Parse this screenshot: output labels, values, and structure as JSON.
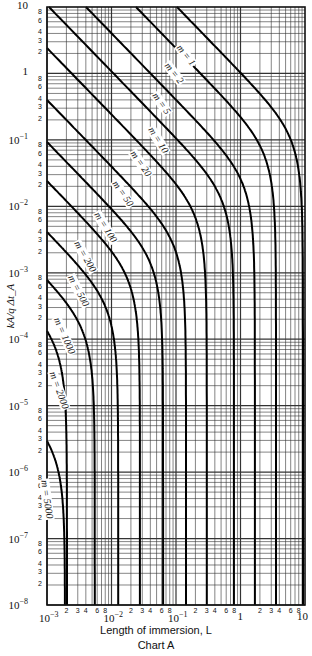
{
  "chart_data": {
    "type": "line",
    "title": "",
    "caption": "Chart A",
    "xlabel": "Length of immersion, L",
    "ylabel": "kA/q Δt_A",
    "xscale": "log",
    "yscale": "log",
    "xlim": [
      0.001,
      10
    ],
    "ylim": [
      1e-08,
      10
    ],
    "grid": true,
    "x_major_ticks": [
      "10^-3",
      "10^-2",
      "10^-1",
      "1",
      "10"
    ],
    "x_minor_tick_labels": [
      "2",
      "3",
      "4",
      "6",
      "8"
    ],
    "y_major_ticks": [
      "10",
      "1",
      "10^-1",
      "10^-2",
      "10^-3",
      "10^-4",
      "10^-5",
      "10^-6",
      "10^-7",
      "10^-8"
    ],
    "y_minor_tick_labels": [
      "8",
      "6",
      "4",
      "3",
      "2"
    ],
    "series": [
      {
        "name": "m = 1",
        "start_px": [
          177,
          7
        ],
        "end_L": 9.3
      },
      {
        "name": "m = 2",
        "start_px": [
          136,
          7
        ],
        "end_L": 3.55
      },
      {
        "name": "m = 5",
        "start_px": [
          86,
          7
        ],
        "end_L": 1.67
      },
      {
        "name": "m = 10",
        "start_px": [
          49,
          7
        ],
        "end_L": 0.79
      },
      {
        "name": "m = 20",
        "start_px": [
          47,
          48
        ],
        "end_L": 0.3
      },
      {
        "name": "m = 50",
        "start_px": [
          47,
          100
        ],
        "end_L": 0.143
      },
      {
        "name": "m = 100",
        "start_px": [
          47,
          142
        ],
        "end_L": 0.063
      },
      {
        "name": "m = 200",
        "start_px": [
          47,
          181
        ],
        "end_L": 0.0276
      },
      {
        "name": "m = 500",
        "start_px": [
          47,
          232
        ],
        "end_L": 0.0127
      },
      {
        "name": "m = 1000",
        "start_px": [
          47,
          280
        ],
        "end_L": 0.0055
      },
      {
        "name": "m = 2000",
        "start_px": [
          47,
          331
        ],
        "end_L": 0.00204
      },
      {
        "name": "m = 5000",
        "start_px": [
          47,
          441
        ],
        "end_L": 0.0019
      }
    ],
    "curve_labels": [
      {
        "text": "m = 1",
        "x": 178,
        "y": 40,
        "rot": 52
      },
      {
        "text": "m = 2",
        "x": 166,
        "y": 58,
        "rot": 52
      },
      {
        "text": "m = 5",
        "x": 154,
        "y": 88,
        "rot": 55
      },
      {
        "text": "m = 10",
        "x": 150,
        "y": 122,
        "rot": 58
      },
      {
        "text": "m = 20",
        "x": 132,
        "y": 146,
        "rot": 55
      },
      {
        "text": "m = 50",
        "x": 114,
        "y": 176,
        "rot": 55
      },
      {
        "text": "m = 100",
        "x": 96,
        "y": 207,
        "rot": 58
      },
      {
        "text": "m = 200",
        "x": 76,
        "y": 236,
        "rot": 60
      },
      {
        "text": "m = 500",
        "x": 70,
        "y": 270,
        "rot": 62
      },
      {
        "text": "m = 1000",
        "x": 56,
        "y": 312,
        "rot": 66
      },
      {
        "text": "m = 2000",
        "x": 52,
        "y": 366,
        "rot": 70
      },
      {
        "text": "m = 5000",
        "x": 44,
        "y": 474,
        "rot": 82
      }
    ]
  }
}
